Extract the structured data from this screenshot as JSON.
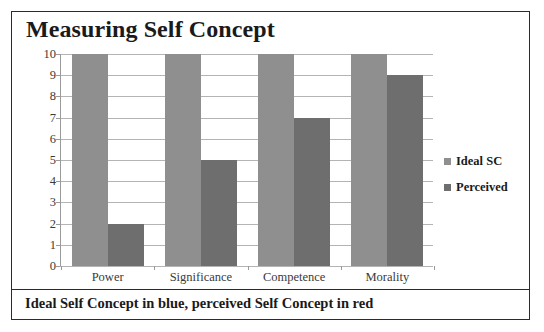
{
  "figure": {
    "title": "Measuring Self Concept",
    "caption": "Ideal Self Concept in blue, perceived Self Concept in red"
  },
  "legend": {
    "items": [
      {
        "label": "Ideal SC",
        "color": "#8f8f8f"
      },
      {
        "label": "Perceived",
        "color": "#6e6e6e"
      }
    ]
  },
  "chart_data": {
    "type": "bar",
    "title": "Measuring Self Concept",
    "xlabel": "",
    "ylabel": "",
    "categories": [
      "Power",
      "Significance",
      "Competence",
      "Morality"
    ],
    "series": [
      {
        "name": "Ideal SC",
        "color": "#8f8f8f",
        "values": [
          10,
          10,
          10,
          10
        ]
      },
      {
        "name": "Perceived",
        "color": "#6e6e6e",
        "values": [
          2,
          5,
          7,
          9
        ]
      }
    ],
    "ylim": [
      0,
      10
    ],
    "ytick_step": 1,
    "yticks": [
      10,
      9,
      8,
      7,
      6,
      5,
      4,
      3,
      2,
      1,
      0
    ],
    "grid": true,
    "grid_axis": "y",
    "legend_position": "right",
    "annotations": [
      "Ideal Self Concept in blue, perceived Self Concept in red"
    ]
  }
}
